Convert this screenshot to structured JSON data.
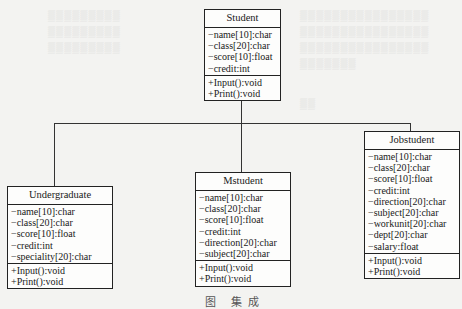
{
  "diagram": {
    "type": "uml-class-inheritance",
    "classes": [
      {
        "name": "Student",
        "attributes": [
          "−name[10]:char",
          "−class[20]:char",
          "−score[10]:float",
          "−credit:int"
        ],
        "methods": [
          "+Input():void",
          "+Print():void"
        ]
      },
      {
        "name": "Undergraduate",
        "attributes": [
          "−name[10]:char",
          "−class[20]:char",
          "−score[10]:float",
          "−credit:int",
          "−speciality[20]:char"
        ],
        "methods": [
          "+Input():void",
          "+Print():void"
        ]
      },
      {
        "name": "Mstudent",
        "attributes": [
          "−name[10]:char",
          "−class[20]:char",
          "−score[10]:float",
          "−credit:int",
          "−direction[20]:char",
          "−subject[20]:char"
        ],
        "methods": [
          "+Input():void",
          "+Print():void"
        ]
      },
      {
        "name": "Jobstudent",
        "attributes": [
          "−name[10]:char",
          "−class[20]:char",
          "−score[10]:float",
          "−credit:int",
          "−direction[20]:char",
          "−subject[20]:char",
          "−workunit[20]:char",
          "−dept[20]:char",
          "−salary:float"
        ],
        "methods": [
          "+Input():void",
          "+Print():void"
        ]
      }
    ],
    "relationships": [
      {
        "parent": "Student",
        "child": "Undergraduate"
      },
      {
        "parent": "Student",
        "child": "Mstudent"
      },
      {
        "parent": "Student",
        "child": "Jobstudent"
      }
    ],
    "caption": "图    集成"
  }
}
